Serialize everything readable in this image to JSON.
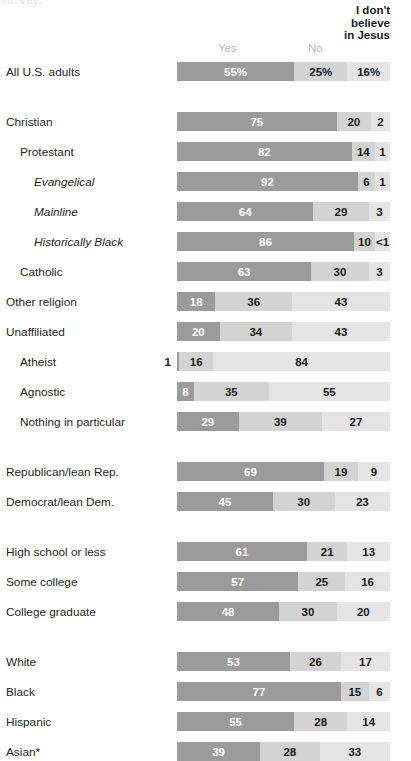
{
  "clipped_title": "survey.",
  "header": {
    "yes": "Yes",
    "no": "No",
    "idb_line1": "I don't",
    "idb_line2": "believe",
    "idb_line3": "in Jesus"
  },
  "colors": {
    "yes": "#9b9b9b",
    "no": "#d3d3d3",
    "idb": "#e4e4e4",
    "text_dark": "#1a1a1a",
    "text_light": "#ffffff",
    "header_muted": "#b9b9b9"
  },
  "chart_data": {
    "type": "bar",
    "subtype": "stacked-horizontal-100",
    "title": "",
    "xlabel": "",
    "ylabel": "",
    "xlim": [
      0,
      100
    ],
    "grid": false,
    "legend_position": "top",
    "legend": [
      "Yes",
      "No",
      "I don't believe in Jesus"
    ],
    "categories": [
      "All U.S. adults",
      "Christian",
      "Protestant",
      "Evangelical",
      "Mainline",
      "Historically Black",
      "Catholic",
      "Other religion",
      "Unaffiliated",
      "Atheist",
      "Agnostic",
      "Nothing in particular",
      "Republican/lean Rep.",
      "Democrat/lean Dem.",
      "High school or less",
      "Some college",
      "College graduate",
      "White",
      "Black",
      "Hispanic",
      "Asian*"
    ],
    "series": [
      {
        "name": "Yes",
        "values": [
          55,
          75,
          82,
          92,
          64,
          86,
          63,
          18,
          20,
          1,
          8,
          29,
          69,
          45,
          61,
          57,
          48,
          53,
          77,
          55,
          39
        ]
      },
      {
        "name": "No",
        "values": [
          25,
          20,
          14,
          6,
          29,
          10,
          30,
          36,
          34,
          16,
          35,
          39,
          19,
          30,
          21,
          25,
          30,
          26,
          15,
          28,
          28
        ]
      },
      {
        "name": "I don't believe in Jesus",
        "values": [
          16,
          2,
          1,
          1,
          3,
          0.5,
          3,
          43,
          43,
          84,
          55,
          27,
          9,
          23,
          13,
          16,
          20,
          17,
          6,
          14,
          33
        ]
      }
    ]
  },
  "rows": [
    {
      "label": "All U.S. adults",
      "indent": 0,
      "italic": false,
      "top": 62,
      "group": 0,
      "segments": [
        {
          "value": 55,
          "display": "55%",
          "width": 55,
          "placement": "inside-dark"
        },
        {
          "value": 25,
          "display": "25%",
          "width": 25,
          "placement": "inside-light"
        },
        {
          "value": 16,
          "display": "16%",
          "width": 20,
          "placement": "inside-light"
        }
      ]
    },
    {
      "label": "Christian",
      "indent": 0,
      "italic": false,
      "top": 112,
      "group": 1,
      "segments": [
        {
          "value": 75,
          "display": "75",
          "width": 75,
          "placement": "inside-dark"
        },
        {
          "value": 20,
          "display": "20",
          "width": 16,
          "placement": "inside-light"
        },
        {
          "value": 2,
          "display": "2",
          "width": 9,
          "placement": "inside-light"
        }
      ]
    },
    {
      "label": "Protestant",
      "indent": 1,
      "italic": false,
      "top": 142,
      "group": 1,
      "segments": [
        {
          "value": 82,
          "display": "82",
          "width": 82,
          "placement": "inside-dark"
        },
        {
          "value": 14,
          "display": "14",
          "width": 11,
          "placement": "inside-light"
        },
        {
          "value": 1,
          "display": "1",
          "width": 7,
          "placement": "inside-light"
        }
      ]
    },
    {
      "label": "Evangelical",
      "indent": 2,
      "italic": true,
      "top": 172,
      "group": 1,
      "segments": [
        {
          "value": 92,
          "display": "92",
          "width": 85,
          "placement": "inside-dark"
        },
        {
          "value": 6,
          "display": "6",
          "width": 8,
          "placement": "inside-light"
        },
        {
          "value": 1,
          "display": "1",
          "width": 7,
          "placement": "inside-light"
        }
      ]
    },
    {
      "label": "Mainline",
      "indent": 2,
      "italic": true,
      "top": 202,
      "group": 1,
      "segments": [
        {
          "value": 64,
          "display": "64",
          "width": 64,
          "placement": "inside-dark"
        },
        {
          "value": 29,
          "display": "29",
          "width": 26,
          "placement": "inside-light"
        },
        {
          "value": 3,
          "display": "3",
          "width": 10,
          "placement": "inside-light"
        }
      ]
    },
    {
      "label": "Historically Black",
      "indent": 2,
      "italic": true,
      "top": 232,
      "group": 1,
      "segments": [
        {
          "value": 86,
          "display": "86",
          "width": 83,
          "placement": "inside-dark"
        },
        {
          "value": 10,
          "display": "10",
          "width": 10,
          "placement": "inside-light"
        },
        {
          "value": 0.5,
          "display": "<1",
          "width": 7,
          "placement": "inside-light"
        }
      ]
    },
    {
      "label": "Catholic",
      "indent": 1,
      "italic": false,
      "top": 262,
      "group": 1,
      "segments": [
        {
          "value": 63,
          "display": "63",
          "width": 63,
          "placement": "inside-dark"
        },
        {
          "value": 30,
          "display": "30",
          "width": 27,
          "placement": "inside-light"
        },
        {
          "value": 3,
          "display": "3",
          "width": 10,
          "placement": "inside-light"
        }
      ]
    },
    {
      "label": "Other religion",
      "indent": 0,
      "italic": false,
      "top": 292,
      "group": 1,
      "segments": [
        {
          "value": 18,
          "display": "18",
          "width": 18,
          "placement": "inside-dark"
        },
        {
          "value": 36,
          "display": "36",
          "width": 36,
          "placement": "inside-light"
        },
        {
          "value": 43,
          "display": "43",
          "width": 46,
          "placement": "inside-light"
        }
      ]
    },
    {
      "label": "Unaffiliated",
      "indent": 0,
      "italic": false,
      "top": 322,
      "group": 1,
      "segments": [
        {
          "value": 20,
          "display": "20",
          "width": 20,
          "placement": "inside-dark"
        },
        {
          "value": 34,
          "display": "34",
          "width": 34,
          "placement": "inside-light"
        },
        {
          "value": 43,
          "display": "43",
          "width": 46,
          "placement": "inside-light"
        }
      ]
    },
    {
      "label": "Atheist",
      "indent": 1,
      "italic": false,
      "top": 352,
      "group": 1,
      "segments": [
        {
          "value": 1,
          "display": "1",
          "width": 1,
          "placement": "outside-left"
        },
        {
          "value": 16,
          "display": "16",
          "width": 16,
          "placement": "inside-light"
        },
        {
          "value": 84,
          "display": "84",
          "width": 83,
          "placement": "inside-light"
        }
      ]
    },
    {
      "label": "Agnostic",
      "indent": 1,
      "italic": false,
      "top": 382,
      "group": 1,
      "segments": [
        {
          "value": 8,
          "display": "8",
          "width": 8,
          "placement": "inside-dark"
        },
        {
          "value": 35,
          "display": "35",
          "width": 35,
          "placement": "inside-light"
        },
        {
          "value": 55,
          "display": "55",
          "width": 57,
          "placement": "inside-light"
        }
      ]
    },
    {
      "label": "Nothing in particular",
      "indent": 1,
      "italic": false,
      "top": 412,
      "group": 1,
      "segments": [
        {
          "value": 29,
          "display": "29",
          "width": 29,
          "placement": "inside-dark"
        },
        {
          "value": 39,
          "display": "39",
          "width": 39,
          "placement": "inside-light"
        },
        {
          "value": 27,
          "display": "27",
          "width": 32,
          "placement": "inside-light"
        }
      ]
    },
    {
      "label": "Republican/lean Rep.",
      "indent": 0,
      "italic": false,
      "top": 462,
      "group": 2,
      "segments": [
        {
          "value": 69,
          "display": "69",
          "width": 69,
          "placement": "inside-dark"
        },
        {
          "value": 19,
          "display": "19",
          "width": 16,
          "placement": "inside-light"
        },
        {
          "value": 9,
          "display": "9",
          "width": 15,
          "placement": "inside-light"
        }
      ]
    },
    {
      "label": "Democrat/lean Dem.",
      "indent": 0,
      "italic": false,
      "top": 492,
      "group": 2,
      "segments": [
        {
          "value": 45,
          "display": "45",
          "width": 45,
          "placement": "inside-dark"
        },
        {
          "value": 30,
          "display": "30",
          "width": 29,
          "placement": "inside-light"
        },
        {
          "value": 23,
          "display": "23",
          "width": 26,
          "placement": "inside-light"
        }
      ]
    },
    {
      "label": "High school or less",
      "indent": 0,
      "italic": false,
      "top": 542,
      "group": 3,
      "segments": [
        {
          "value": 61,
          "display": "61",
          "width": 61,
          "placement": "inside-dark"
        },
        {
          "value": 21,
          "display": "21",
          "width": 19,
          "placement": "inside-light"
        },
        {
          "value": 13,
          "display": "13",
          "width": 20,
          "placement": "inside-light"
        }
      ]
    },
    {
      "label": "Some college",
      "indent": 0,
      "italic": false,
      "top": 572,
      "group": 3,
      "segments": [
        {
          "value": 57,
          "display": "57",
          "width": 57,
          "placement": "inside-dark"
        },
        {
          "value": 25,
          "display": "25",
          "width": 22,
          "placement": "inside-light"
        },
        {
          "value": 16,
          "display": "16",
          "width": 21,
          "placement": "inside-light"
        }
      ]
    },
    {
      "label": "College graduate",
      "indent": 0,
      "italic": false,
      "top": 602,
      "group": 3,
      "segments": [
        {
          "value": 48,
          "display": "48",
          "width": 48,
          "placement": "inside-dark"
        },
        {
          "value": 30,
          "display": "30",
          "width": 27,
          "placement": "inside-light"
        },
        {
          "value": 20,
          "display": "20",
          "width": 25,
          "placement": "inside-light"
        }
      ]
    },
    {
      "label": "White",
      "indent": 0,
      "italic": false,
      "top": 652,
      "group": 4,
      "segments": [
        {
          "value": 53,
          "display": "53",
          "width": 53,
          "placement": "inside-dark"
        },
        {
          "value": 26,
          "display": "26",
          "width": 24,
          "placement": "inside-light"
        },
        {
          "value": 17,
          "display": "17",
          "width": 23,
          "placement": "inside-light"
        }
      ]
    },
    {
      "label": "Black",
      "indent": 0,
      "italic": false,
      "top": 682,
      "group": 4,
      "segments": [
        {
          "value": 77,
          "display": "77",
          "width": 77,
          "placement": "inside-dark"
        },
        {
          "value": 15,
          "display": "15",
          "width": 13,
          "placement": "inside-light"
        },
        {
          "value": 6,
          "display": "6",
          "width": 10,
          "placement": "inside-light"
        }
      ]
    },
    {
      "label": "Hispanic",
      "indent": 0,
      "italic": false,
      "top": 712,
      "group": 4,
      "segments": [
        {
          "value": 55,
          "display": "55",
          "width": 55,
          "placement": "inside-dark"
        },
        {
          "value": 28,
          "display": "28",
          "width": 25,
          "placement": "inside-light"
        },
        {
          "value": 14,
          "display": "14",
          "width": 20,
          "placement": "inside-light"
        }
      ]
    },
    {
      "label": "Asian*",
      "indent": 0,
      "italic": false,
      "top": 742,
      "group": 4,
      "segments": [
        {
          "value": 39,
          "display": "39",
          "width": 39,
          "placement": "inside-dark"
        },
        {
          "value": 28,
          "display": "28",
          "width": 28,
          "placement": "inside-light"
        },
        {
          "value": 33,
          "display": "33",
          "width": 33,
          "placement": "inside-light"
        }
      ]
    }
  ]
}
